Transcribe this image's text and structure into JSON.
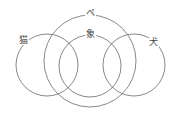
{
  "diagram": {
    "type": "venn",
    "stroke_color": "#6a6a6a",
    "background": "#ffffff",
    "sets": [
      {
        "id": "cat",
        "label": "猫",
        "cx": 47,
        "cy": 65,
        "r": 31,
        "label_x": 17,
        "label_y": 36
      },
      {
        "id": "pe",
        "label": "ペ",
        "cx": 90,
        "cy": 61,
        "r": 46,
        "label_x": 85,
        "label_y": 10
      },
      {
        "id": "elephant",
        "label": "象",
        "cx": 90,
        "cy": 66,
        "r": 31,
        "label_x": 85,
        "label_y": 30
      },
      {
        "id": "dog",
        "label": "犬",
        "cx": 134,
        "cy": 65,
        "r": 31,
        "label_x": 148,
        "label_y": 38
      }
    ]
  }
}
